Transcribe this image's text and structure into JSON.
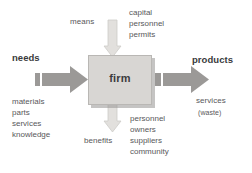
{
  "diagram": {
    "center": {
      "box_label": "firm",
      "box_color": "#d8d6d3"
    },
    "left": {
      "heading": "needs",
      "items": [
        "materials",
        "parts",
        "services",
        "knowledge"
      ],
      "arrow": "right-arrow-into-firm"
    },
    "right": {
      "heading": "products",
      "items": [
        "services",
        "(waste)"
      ],
      "arrow": "right-arrow-out-of-firm"
    },
    "top": {
      "heading": "means",
      "items": [
        "capital",
        "personnel",
        "permits"
      ],
      "arrow": "down-arrow-into-firm"
    },
    "bottom": {
      "heading": "benefits",
      "items": [
        "personnel",
        "owners",
        "suppliers",
        "community"
      ],
      "arrow": "down-arrow-out-of-firm"
    },
    "colors": {
      "arrow_dark": "#9b9997",
      "arrow_light": "#dcdad7",
      "text": "#58585a",
      "heading": "#3a3a3c"
    }
  }
}
